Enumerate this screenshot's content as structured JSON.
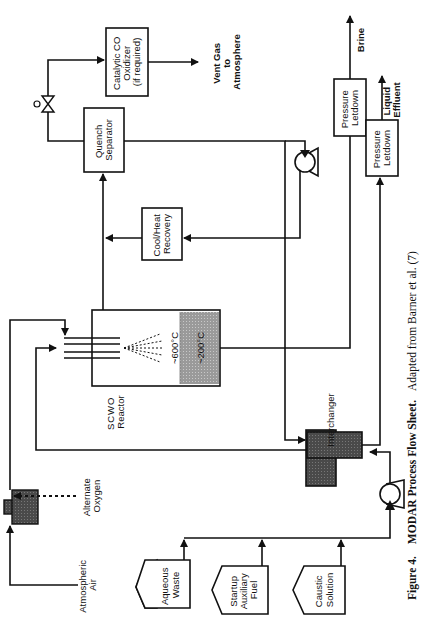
{
  "figure": {
    "caption_prefix": "Figure 4.",
    "caption_title": "MODAR Process Flow Sheet.",
    "caption_rest": "Adapted from Barner et al. (7)",
    "orientation": "rotated 90° counter-clockwise"
  },
  "feeds": {
    "aqueous_waste": [
      "Aqueous",
      "Waste"
    ],
    "startup_fuel": [
      "Startup",
      "Auxiliary",
      "Fuel"
    ],
    "caustic": [
      "Caustic",
      "Solution"
    ],
    "atmospheric_air": [
      "Atmospheric",
      "Air"
    ],
    "alternate_oxygen": [
      "Alternate",
      "Oxygen"
    ]
  },
  "units": {
    "reactor": [
      "SCWO",
      "Reactor"
    ],
    "reactor_top_temp": "~600°C",
    "reactor_bottom_temp": "~200°C",
    "interchanger": "Interchanger",
    "cool_heat": [
      "Cool/Heat",
      "Recovery"
    ],
    "quench": [
      "Quench",
      "Separator"
    ],
    "oxidizer": [
      "Catalytic CO",
      "Oxidizer",
      "(if required)"
    ],
    "letdown_brine": [
      "Pressure",
      "Letdown"
    ],
    "letdown_liquid": [
      "Pressure",
      "Letdown"
    ]
  },
  "outputs": {
    "vent": [
      "Vent Gas",
      "to",
      "Atmosphere"
    ],
    "brine": "Brine",
    "liquid": [
      "Liquid",
      "Effluent"
    ]
  }
}
